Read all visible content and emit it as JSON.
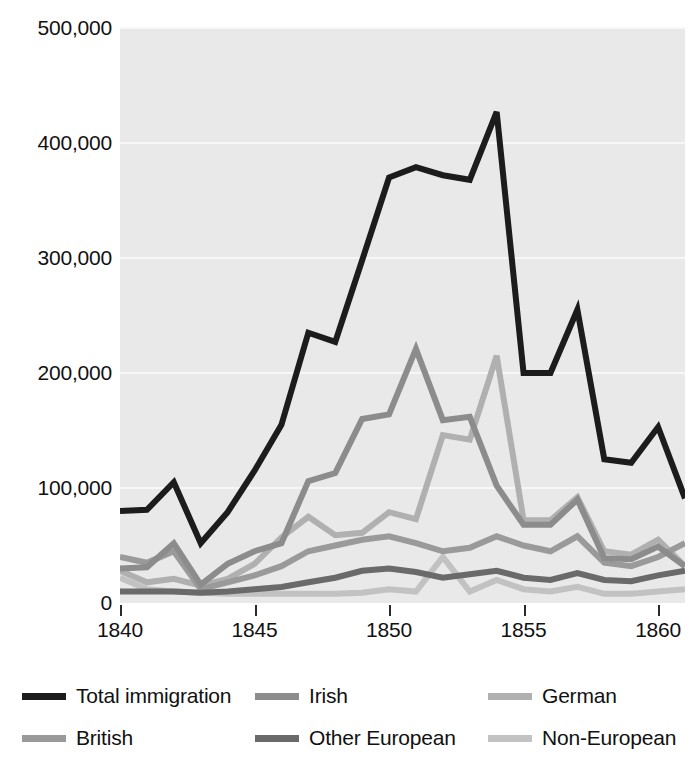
{
  "chart_data": {
    "type": "line",
    "title": "",
    "subtitle": "",
    "xlabel": "",
    "ylabel": "",
    "xlim": [
      1840,
      1861
    ],
    "ylim": [
      0,
      500000
    ],
    "grid": true,
    "legend_position": "bottom",
    "x": [
      1840,
      1841,
      1842,
      1843,
      1844,
      1845,
      1846,
      1847,
      1848,
      1849,
      1850,
      1851,
      1852,
      1853,
      1854,
      1855,
      1856,
      1857,
      1858,
      1859,
      1860,
      1861
    ],
    "y_ticks": [
      0,
      100000,
      200000,
      300000,
      400000,
      500000
    ],
    "y_tick_labels": [
      "0",
      "100,000",
      "200,000",
      "300,000",
      "400,000",
      "500,000"
    ],
    "x_ticks": [
      1840,
      1845,
      1850,
      1855,
      1860
    ],
    "x_tick_labels": [
      "1840",
      "1845",
      "1850",
      "1855",
      "1860"
    ],
    "series": [
      {
        "name": "Total immigration",
        "color": "#1c1c1c",
        "width": 6,
        "values": [
          80000,
          81000,
          105000,
          52000,
          79000,
          115000,
          155000,
          235000,
          227000,
          298000,
          370000,
          379000,
          372000,
          368000,
          427000,
          200000,
          200000,
          255000,
          125000,
          122000,
          153000,
          91000
        ]
      },
      {
        "name": "Irish",
        "color": "#8c8c8c",
        "width": 6,
        "values": [
          30000,
          31000,
          52000,
          16000,
          34000,
          45000,
          52000,
          106000,
          113000,
          160000,
          164000,
          221000,
          159000,
          162000,
          102000,
          68000,
          68000,
          90000,
          39000,
          38000,
          49000,
          32000
        ]
      },
      {
        "name": "German",
        "color": "#b0b0b0",
        "width": 6,
        "values": [
          28000,
          18000,
          21000,
          15000,
          21000,
          34000,
          57000,
          75000,
          59000,
          61000,
          79000,
          73000,
          146000,
          142000,
          215000,
          72000,
          72000,
          92000,
          45000,
          42000,
          55000,
          32000
        ]
      },
      {
        "name": "British",
        "color": "#9a9a9a",
        "width": 6,
        "values": [
          40000,
          35000,
          45000,
          12000,
          18000,
          24000,
          32000,
          45000,
          50000,
          55000,
          58000,
          52000,
          45000,
          48000,
          58000,
          50000,
          45000,
          58000,
          35000,
          32000,
          40000,
          52000
        ]
      },
      {
        "name": "Other European",
        "color": "#6a6a6a",
        "width": 6,
        "values": [
          10000,
          10000,
          10000,
          9000,
          10000,
          12000,
          14000,
          18000,
          22000,
          28000,
          30000,
          27000,
          22000,
          25000,
          28000,
          22000,
          20000,
          26000,
          20000,
          19000,
          24000,
          28000
        ]
      },
      {
        "name": "Non-European",
        "color": "#c2c2c2",
        "width": 6,
        "values": [
          22000,
          12000,
          10000,
          9000,
          8000,
          8000,
          8000,
          8000,
          8000,
          9000,
          12000,
          10000,
          40000,
          10000,
          20000,
          12000,
          10000,
          14000,
          8000,
          8000,
          10000,
          12000
        ]
      }
    ]
  },
  "legend": {
    "rows": [
      [
        {
          "label": "Total immigration",
          "color": "#1c1c1c"
        },
        {
          "label": "Irish",
          "color": "#8c8c8c"
        },
        {
          "label": "German",
          "color": "#b0b0b0"
        }
      ],
      [
        {
          "label": "British",
          "color": "#9a9a9a"
        },
        {
          "label": "Other European",
          "color": "#6a6a6a"
        },
        {
          "label": "Non-European",
          "color": "#c2c2c2"
        }
      ]
    ]
  },
  "colors": {
    "plot_background": "#e9e9e9",
    "gridline": "#f7f7f7",
    "page_background": "#ffffff",
    "text": "#111111"
  }
}
